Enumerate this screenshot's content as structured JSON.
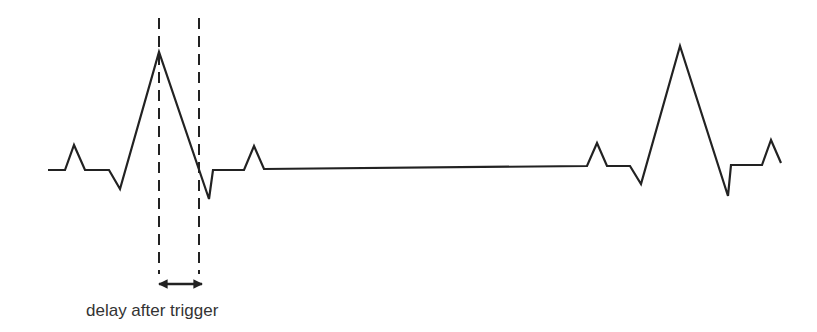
{
  "diagram": {
    "caption": "delay after trigger",
    "colors": {
      "trace": "#222222",
      "background": "#ffffff",
      "text": "#333333"
    },
    "elements": [
      {
        "id": "waveform-trace",
        "type": "polyline",
        "label": "signal trace"
      },
      {
        "id": "trigger-marker",
        "type": "dashed-line",
        "label": "trigger point at first R-peak"
      },
      {
        "id": "delay-end-marker",
        "type": "dashed-line",
        "label": "end of delay window"
      },
      {
        "id": "delay-arrow",
        "type": "double-arrow",
        "label": "delay after trigger"
      }
    ]
  }
}
